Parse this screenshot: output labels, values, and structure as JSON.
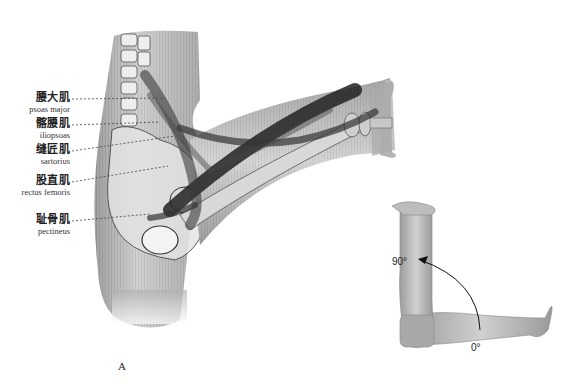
{
  "figure": {
    "panel_label": "A",
    "muscles": [
      {
        "zh": "腰大肌",
        "en": "psoas major",
        "y": 96
      },
      {
        "zh": "髂腰肌",
        "en": "iliopsoas",
        "y": 122
      },
      {
        "zh": "缝匠肌",
        "en": "sartorius",
        "y": 148
      },
      {
        "zh": "股直肌",
        "en": "rectus femoris",
        "y": 179
      },
      {
        "zh": "耻骨肌",
        "en": "pectineus",
        "y": 218
      }
    ],
    "range_of_motion": {
      "start_angle": "0°",
      "end_angle": "90°"
    },
    "colors": {
      "skin": "#b8b8b8",
      "muscle": "#2a2a2a",
      "bone": "#e6e6e6",
      "text": "#222222"
    }
  }
}
